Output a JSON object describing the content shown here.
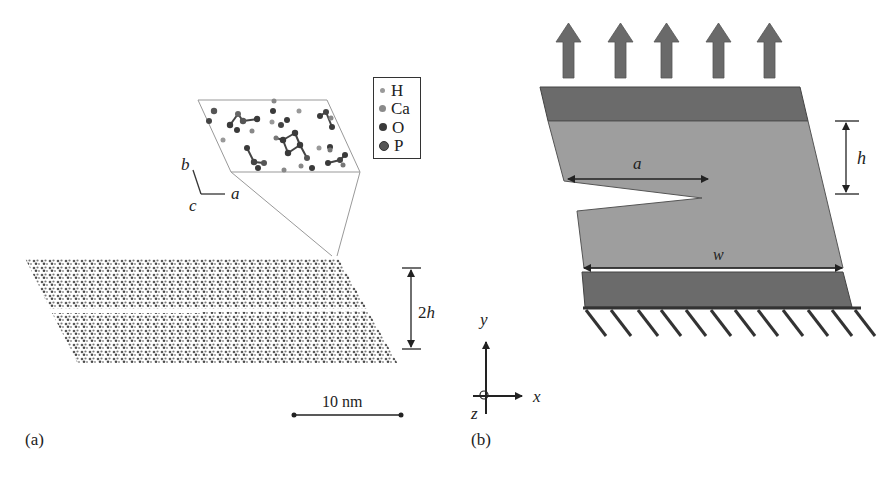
{
  "panel_a": {
    "label": "(a)",
    "legend": [
      {
        "symbol": "H",
        "color": "#9a9a9a",
        "size": 5
      },
      {
        "symbol": "Ca",
        "color": "#8a8a8a",
        "size": 7
      },
      {
        "symbol": "O",
        "color": "#3a3a3a",
        "size": 8
      },
      {
        "symbol": "P",
        "color": "#555555",
        "size": 9
      }
    ],
    "axes": {
      "b": "b",
      "c": "c",
      "a": "a"
    },
    "height_label_prefix": "2",
    "height_label_var": "h",
    "scale_bar": "10 nm"
  },
  "panel_b": {
    "label": "(b)",
    "crack_label": "a",
    "height_label": "h",
    "width_label": "w",
    "load_arrows": 5,
    "hatch_count": 12,
    "coords": {
      "y": "y",
      "x": "x",
      "z": "z"
    },
    "colors": {
      "grip": "#6b6b6b",
      "body": "#9e9e9e",
      "arrow": "#6a6a6a",
      "line": "#333333"
    }
  }
}
